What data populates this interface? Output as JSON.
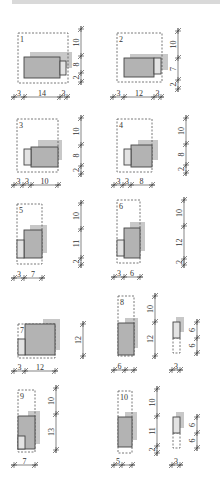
{
  "colors": {
    "main_block": "#b3b3b3",
    "light_block": "#e3e3e3",
    "shadow": "#c8c8c8",
    "line": "#444444",
    "topbar": "#d9d9d9"
  },
  "variants": [
    {
      "id": "1",
      "label": "1",
      "frame": [
        18,
        33,
        68,
        83
      ],
      "shadow": [
        [
          30,
          52,
          72,
          68
        ]
      ],
      "main": [
        [
          24,
          57,
          60,
          78
        ]
      ],
      "light": [
        [
          60,
          61,
          66,
          75
        ]
      ],
      "vdim": {
        "x": 81,
        "ticks": [
          29,
          56,
          73,
          82
        ],
        "labels": [
          "10",
          "8",
          "2"
        ]
      },
      "hdim": {
        "y": 97,
        "ticks": [
          14,
          24,
          60,
          67
        ],
        "labels": [
          "3",
          "14",
          "3"
        ]
      }
    },
    {
      "id": "2",
      "label": "2",
      "frame": [
        117,
        33,
        162,
        82
      ],
      "shadow": [
        [
          130,
          54,
          168,
          70
        ]
      ],
      "main": [
        [
          124,
          58,
          154,
          77
        ]
      ],
      "light": [
        [
          154,
          58,
          161,
          74
        ]
      ],
      "vdim": {
        "x": 178,
        "ticks": [
          31,
          58,
          80,
          89
        ],
        "labels": [
          "10",
          "7",
          "2"
        ]
      },
      "hdim": {
        "y": 97,
        "ticks": [
          113,
          124,
          154,
          161
        ],
        "labels": [
          "3",
          "12",
          "3"
        ]
      }
    },
    {
      "id": "3",
      "label": "3",
      "frame": [
        17,
        119,
        58,
        172
      ],
      "shadow": [
        [
          38,
          140,
          62,
          160
        ]
      ],
      "main": [
        [
          31,
          147,
          58,
          167
        ]
      ],
      "light": [
        [
          24,
          149,
          31,
          165
        ]
      ],
      "vdim": {
        "x": 81,
        "ticks": [
          118,
          145,
          166,
          174
        ],
        "labels": [
          "10",
          "8",
          "2"
        ]
      },
      "hdim": {
        "y": 185,
        "ticks": [
          14,
          23,
          31,
          58
        ],
        "labels": [
          "3",
          "3",
          "10"
        ]
      }
    },
    {
      "id": "4",
      "label": "4",
      "frame": [
        117,
        119,
        152,
        172
      ],
      "shadow": [
        [
          138,
          140,
          158,
          160
        ]
      ],
      "main": [
        [
          131,
          145,
          152,
          167
        ]
      ],
      "light": [
        [
          124,
          149,
          131,
          165
        ]
      ],
      "vdim": {
        "x": 186,
        "ticks": [
          118,
          144,
          165,
          173
        ],
        "labels": [
          "10",
          "8",
          "2"
        ]
      },
      "hdim": {
        "y": 185,
        "ticks": [
          114,
          123,
          131,
          152
        ],
        "labels": [
          "3",
          "3",
          "8"
        ]
      }
    },
    {
      "id": "5",
      "label": "5",
      "frame": [
        17,
        204,
        42,
        264
      ],
      "shadow": [
        [
          30,
          225,
          47,
          253
        ]
      ],
      "main": [
        [
          24,
          230,
          42,
          258
        ]
      ],
      "light": [
        [
          17,
          240,
          24,
          258
        ]
      ],
      "vdim": {
        "x": 81,
        "ticks": [
          203,
          229,
          258,
          265
        ],
        "labels": [
          "10",
          "11",
          "2"
        ]
      },
      "hdim": {
        "y": 278,
        "ticks": [
          14,
          24,
          42
        ],
        "labels": [
          "3",
          "7"
        ]
      }
    },
    {
      "id": "6",
      "label": "6",
      "frame": [
        117,
        200,
        140,
        263
      ],
      "shadow": [
        [
          130,
          222,
          145,
          251
        ]
      ],
      "main": [
        [
          124,
          228,
          140,
          258
        ]
      ],
      "light": [
        [
          117,
          240,
          124,
          256
        ]
      ],
      "vdim": {
        "x": 184,
        "ticks": [
          200,
          226,
          259,
          265
        ],
        "labels": [
          "10",
          "12",
          "2"
        ]
      },
      "hdim": {
        "y": 277,
        "ticks": [
          114,
          124,
          140
        ],
        "labels": [
          "3",
          "6"
        ]
      }
    },
    {
      "id": "7",
      "label": "7",
      "frame": [
        18,
        324,
        55,
        358
      ],
      "shadow": [
        [
          43,
          319,
          60,
          350
        ]
      ],
      "main": [
        [
          25,
          324,
          55,
          355
        ]
      ],
      "light": [
        [
          18,
          339,
          25,
          355
        ]
      ],
      "vdim": {
        "x": 83,
        "ticks": [
          324,
          356
        ],
        "labels": [
          "12"
        ]
      },
      "hdim": {
        "y": 371,
        "ticks": [
          14,
          25,
          55
        ],
        "labels": [
          "3",
          "12"
        ]
      }
    },
    {
      "id": "8",
      "label": "8",
      "frame": [
        118,
        296,
        134,
        356
      ],
      "shadow": [
        [
          125,
          318,
          138,
          348
        ]
      ],
      "main": [
        [
          118,
          323,
          134,
          355
        ]
      ],
      "light": [],
      "vdim": {
        "x": 155,
        "ticks": [
          296,
          322,
          356
        ],
        "labels": [
          "10",
          "12"
        ]
      },
      "hdim": {
        "y": 370,
        "ticks": [
          114,
          125,
          134
        ],
        "labels": [
          "6"
        ]
      }
    },
    {
      "id": "9",
      "label": "9",
      "frame": [
        18,
        390,
        35,
        452
      ],
      "shadow": [
        [
          28,
          411,
          40,
          444
        ]
      ],
      "main": [
        [
          18,
          416,
          35,
          449
        ]
      ],
      "light": [
        [
          18,
          436,
          25,
          449
        ]
      ],
      "vdim": {
        "x": 56,
        "ticks": [
          388,
          414,
          450
        ],
        "labels": [
          "10",
          "13"
        ]
      },
      "hdim": {
        "y": 465,
        "ticks": [
          14,
          35
        ],
        "labels": [
          "7"
        ]
      }
    },
    {
      "id": "10",
      "label": "10",
      "frame": [
        118,
        391,
        132,
        453
      ],
      "shadow": [
        [
          125,
          412,
          137,
          440
        ]
      ],
      "main": [
        [
          118,
          417,
          132,
          447
        ]
      ],
      "light": [],
      "vdim": {
        "x": 157,
        "ticks": [
          389,
          416,
          446,
          453
        ],
        "labels": [
          "10",
          "11",
          "2"
        ]
      },
      "hdim": {
        "y": 465,
        "ticks": [
          114,
          122,
          132
        ],
        "labels": [
          "5"
        ]
      }
    }
  ],
  "small_units": [
    {
      "id": "8b",
      "shadow": [
        176,
        317,
        184,
        332
      ],
      "light": [
        173,
        322,
        180,
        338
      ],
      "dashed": [
        173,
        338,
        180,
        353
      ],
      "vdim": {
        "x": 197,
        "ticks": [
          322,
          338,
          353
        ],
        "labels": [
          "6",
          "6"
        ]
      },
      "hdim": {
        "y": 370,
        "ticks": [
          172,
          180
        ],
        "labels": [
          "3"
        ]
      }
    },
    {
      "id": "10b",
      "shadow": [
        176,
        412,
        184,
        428
      ],
      "light": [
        173,
        417,
        180,
        433
      ],
      "dashed": [
        173,
        433,
        180,
        448
      ],
      "vdim": {
        "x": 197,
        "ticks": [
          417,
          433,
          448
        ],
        "labels": [
          "6",
          "6"
        ]
      },
      "hdim": {
        "y": 465,
        "ticks": [
          172,
          180
        ],
        "labels": [
          "3"
        ]
      }
    }
  ]
}
